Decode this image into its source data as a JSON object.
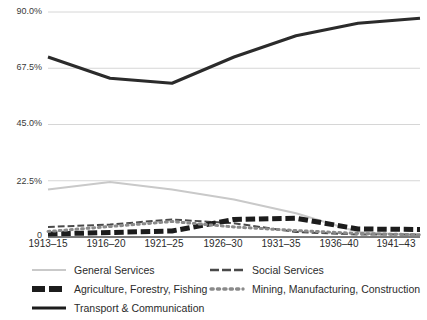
{
  "chart_data": {
    "type": "line",
    "title": "",
    "subtitle": "",
    "xlabel": "",
    "ylabel": "",
    "grid": true,
    "legend_position": "bottom",
    "categories": [
      "1913–15",
      "1916–20",
      "1921–25",
      "1926–30",
      "1931–35",
      "1936–40",
      "1941–43"
    ],
    "x": [
      "1913–15",
      "1916–20",
      "1921–25",
      "1926–30",
      "1931–35",
      "1936–40",
      "1941–43"
    ],
    "ylim": [
      0,
      90
    ],
    "yticks": [
      0,
      22.5,
      45.0,
      67.5,
      90.0
    ],
    "ytick_labels": [
      "0",
      "22.5%",
      "45.0%",
      "67.5%",
      "90.0%"
    ],
    "series": [
      {
        "name": "General Services",
        "style": "solid",
        "color": "#c9c9c9",
        "width": 2,
        "values": [
          19.0,
          22.0,
          19.0,
          15.0,
          9.5,
          2.0,
          0.6
        ]
      },
      {
        "name": "Social Services",
        "style": "dashed",
        "color": "#4a4a4a",
        "width": 2,
        "values": [
          4.0,
          5.0,
          7.0,
          5.5,
          2.0,
          1.0,
          1.0
        ]
      },
      {
        "name": "Agriculture, Forestry, Fishing",
        "style": "thick-dashed",
        "color": "#1c1c1c",
        "width": 5,
        "values": [
          1.2,
          1.8,
          2.4,
          7.0,
          7.5,
          3.2,
          3.0
        ]
      },
      {
        "name": "Mining, Manufacturing, Construction",
        "style": "dotted",
        "color": "#8a8a8a",
        "width": 3,
        "values": [
          2.2,
          4.2,
          6.2,
          4.0,
          2.6,
          1.4,
          0.9
        ]
      },
      {
        "name": "Transport & Communication",
        "style": "solid",
        "color": "#2b2b2b",
        "width": 3,
        "values": [
          72.0,
          63.5,
          61.5,
          72.0,
          80.5,
          85.5,
          87.5
        ]
      }
    ]
  },
  "legend": {
    "entries": [
      {
        "label": "General Services",
        "swatch": "line-solid-light"
      },
      {
        "label": "Social Services",
        "swatch": "line-dashed-dark"
      },
      {
        "label": "Agriculture, Forestry, Fishing",
        "swatch": "line-thickdash-black"
      },
      {
        "label": "Mining, Manufacturing, Construction",
        "swatch": "line-dotted-gray"
      },
      {
        "label": "Transport & Communication",
        "swatch": "line-solid-black"
      }
    ]
  },
  "axes": {
    "y_labels": [
      "90.0%",
      "67.5%",
      "45.0%",
      "22.5%",
      "0"
    ],
    "x_labels": [
      "1913–15",
      "1916–20",
      "1921–25",
      "1926–30",
      "1931–35",
      "1936–40",
      "1941–43"
    ]
  },
  "colors": {
    "grid": "#d6d6d6",
    "axis_text": "#2b2b2b",
    "general_services": "#c9c9c9",
    "social_services": "#4a4a4a",
    "agriculture": "#1c1c1c",
    "mining": "#8a8a8a",
    "transport": "#2b2b2b"
  }
}
